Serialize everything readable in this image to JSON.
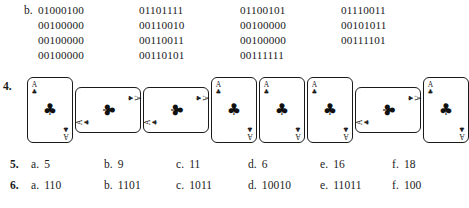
{
  "binary_exercise": {
    "label": "b.",
    "rows": [
      [
        "01000100",
        "01101111",
        "01100101",
        "01110011"
      ],
      [
        "00100000",
        "00110010",
        "00100000",
        "00101011"
      ],
      [
        "00100000",
        "00110011",
        "00100000",
        "00111101"
      ],
      [
        "00100000",
        "00110101",
        "00111111"
      ]
    ]
  },
  "card_exercise": {
    "label": "4.",
    "card_rank": "A",
    "card_suit": "♣",
    "cards": [
      {
        "orientation": "upright",
        "left": 27
      },
      {
        "orientation": "landscape",
        "left": 75
      },
      {
        "orientation": "landscape",
        "left": 143
      },
      {
        "orientation": "upright",
        "left": 211
      },
      {
        "orientation": "upright",
        "left": 259
      },
      {
        "orientation": "upright",
        "left": 307
      },
      {
        "orientation": "landscape",
        "left": 355
      },
      {
        "orientation": "upright",
        "left": 423
      }
    ]
  },
  "answer_rows": [
    {
      "number": "5.",
      "items": [
        {
          "letter": "a.",
          "value": "5"
        },
        {
          "letter": "b.",
          "value": "9"
        },
        {
          "letter": "c.",
          "value": "11"
        },
        {
          "letter": "d.",
          "value": "6"
        },
        {
          "letter": "e.",
          "value": "16"
        },
        {
          "letter": "f.",
          "value": "18"
        }
      ]
    },
    {
      "number": "6.",
      "items": [
        {
          "letter": "a.",
          "value": "110"
        },
        {
          "letter": "b.",
          "value": "1101"
        },
        {
          "letter": "c.",
          "value": "1011"
        },
        {
          "letter": "d.",
          "value": "10010"
        },
        {
          "letter": "e.",
          "value": "11011"
        },
        {
          "letter": "f.",
          "value": "100"
        }
      ]
    }
  ],
  "colors": {
    "page_background": "#ffffff",
    "ink": "#1a1a1a",
    "card_outline": "#1a1a1a"
  }
}
